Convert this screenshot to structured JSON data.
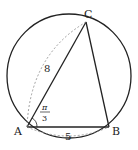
{
  "diagram": {
    "type": "inscribed-triangle",
    "vertices": {
      "A": {
        "label": "A",
        "x": 27,
        "y": 127
      },
      "B": {
        "label": "B",
        "x": 109,
        "y": 127
      },
      "C": {
        "label": "C",
        "x": 86,
        "y": 22
      }
    },
    "circle": {
      "cx": 69,
      "cy": 76,
      "r": 62
    },
    "side_labels": {
      "AC": "8",
      "AB": "5"
    },
    "angle_A": {
      "numerator": "π",
      "denominator": "3"
    },
    "colors": {
      "stroke": "#222222",
      "dashed": "#888888",
      "background": "#ffffff"
    }
  }
}
